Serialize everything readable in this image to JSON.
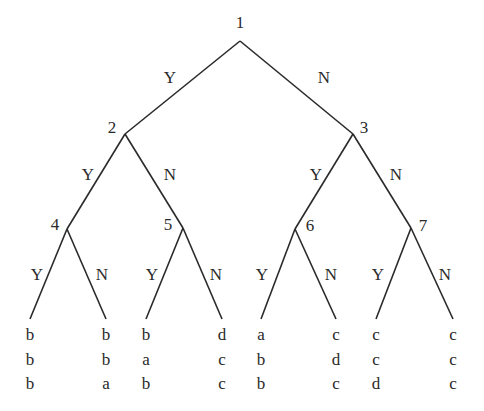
{
  "tree": {
    "nodes": [
      {
        "id": "1",
        "x": 240,
        "y": 41,
        "label_x": 240,
        "label_y": 22
      },
      {
        "id": "2",
        "x": 125,
        "y": 134,
        "label_x": 112,
        "label_y": 127
      },
      {
        "id": "3",
        "x": 353,
        "y": 134,
        "label_x": 364,
        "label_y": 127
      },
      {
        "id": "4",
        "x": 67,
        "y": 229,
        "label_x": 55,
        "label_y": 224
      },
      {
        "id": "5",
        "x": 183,
        "y": 228,
        "label_x": 168,
        "label_y": 224
      },
      {
        "id": "6",
        "x": 295,
        "y": 229,
        "label_x": 310,
        "label_y": 225
      },
      {
        "id": "7",
        "x": 411,
        "y": 228,
        "label_x": 423,
        "label_y": 225
      }
    ],
    "edges": [
      {
        "from": "1",
        "to": "2",
        "label": "Y",
        "lx": 170,
        "ly": 77
      },
      {
        "from": "1",
        "to": "3",
        "label": "N",
        "lx": 324,
        "ly": 77
      },
      {
        "from": "2",
        "to": "4",
        "label": "Y",
        "lx": 88,
        "ly": 174
      },
      {
        "from": "2",
        "to": "5",
        "label": "N",
        "lx": 170,
        "ly": 174
      },
      {
        "from": "3",
        "to": "6",
        "label": "Y",
        "lx": 316,
        "ly": 174
      },
      {
        "from": "3",
        "to": "7",
        "label": "N",
        "lx": 396,
        "ly": 174
      },
      {
        "from": "4",
        "to": "leaf1",
        "label": "Y",
        "lx": 37,
        "ly": 274
      },
      {
        "from": "4",
        "to": "leaf2",
        "label": "N",
        "lx": 102,
        "ly": 274
      },
      {
        "from": "5",
        "to": "leaf3",
        "label": "Y",
        "lx": 152,
        "ly": 274
      },
      {
        "from": "5",
        "to": "leaf4",
        "label": "N",
        "lx": 216,
        "ly": 274
      },
      {
        "from": "6",
        "to": "leaf5",
        "label": "Y",
        "lx": 262,
        "ly": 274
      },
      {
        "from": "6",
        "to": "leaf6",
        "label": "N",
        "lx": 331,
        "ly": 274
      },
      {
        "from": "7",
        "to": "leaf7",
        "label": "Y",
        "lx": 378,
        "ly": 274
      },
      {
        "from": "7",
        "to": "leaf8",
        "label": "N",
        "lx": 445,
        "ly": 274
      }
    ],
    "leaves": [
      {
        "id": "leaf1",
        "x": 30,
        "values": [
          "b",
          "b",
          "b"
        ]
      },
      {
        "id": "leaf2",
        "x": 106,
        "values": [
          "b",
          "b",
          "a"
        ]
      },
      {
        "id": "leaf3",
        "x": 146,
        "values": [
          "b",
          "a",
          "b"
        ]
      },
      {
        "id": "leaf4",
        "x": 222,
        "values": [
          "d",
          "c",
          "c"
        ]
      },
      {
        "id": "leaf5",
        "x": 261,
        "values": [
          "a",
          "b",
          "b"
        ]
      },
      {
        "id": "leaf6",
        "x": 336,
        "values": [
          "c",
          "d",
          "c"
        ]
      },
      {
        "id": "leaf7",
        "x": 376,
        "values": [
          "c",
          "c",
          "d"
        ]
      },
      {
        "id": "leaf8",
        "x": 453,
        "values": [
          "c",
          "c",
          "c"
        ]
      }
    ],
    "leaf_line_end_y": 319,
    "leaf_text_top_y": 323,
    "line_color": "#2a2a2a"
  }
}
